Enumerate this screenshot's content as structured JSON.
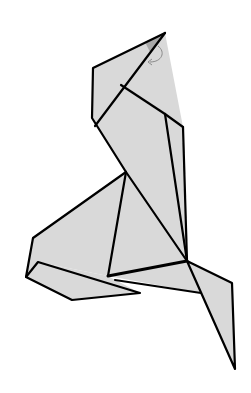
{
  "diagram": {
    "fill_color": "#d9d9d9",
    "tip_shade_color": "#a8a8a8",
    "line_color": "#000000",
    "arrow_color": "#8a8a8a",
    "annotation": "reverse-fold arrow at head tip"
  }
}
